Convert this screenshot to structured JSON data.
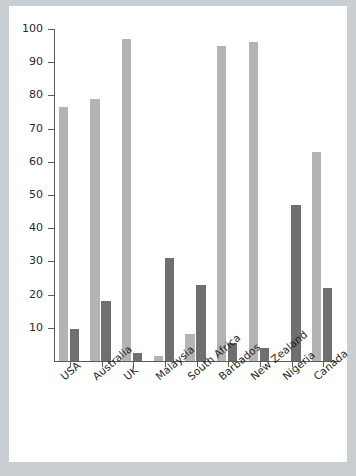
{
  "chart_data": {
    "type": "bar",
    "title": "",
    "subtitle": "",
    "xlabel": "",
    "ylabel": "",
    "ylim": [
      0,
      100
    ],
    "yticks": [
      10,
      20,
      30,
      40,
      50,
      60,
      70,
      80,
      90,
      100
    ],
    "ytick_labels": [
      "10",
      "20",
      "30",
      "40",
      "50",
      "60",
      "70",
      "80",
      "90",
      "100"
    ],
    "grid": false,
    "legend": "none",
    "categories": [
      "USA",
      "Australia",
      "UK",
      "Malaysia",
      "South Africa",
      "Barbados",
      "New Zealand",
      "Nigeria",
      "Canada"
    ],
    "series": [
      {
        "name": "series-1",
        "color": "#b4b4b4",
        "values": [
          76.5,
          79,
          97,
          1.5,
          8,
          95,
          96,
          0,
          63
        ]
      },
      {
        "name": "series-2",
        "color": "#6f6f6f",
        "values": [
          9.5,
          18,
          2.5,
          31,
          23,
          5.5,
          4,
          47,
          22
        ]
      }
    ]
  },
  "style": {
    "page_background": "#c9ced3",
    "plot_background": "#ffffff",
    "axis_color": "#5a5a5a",
    "tick_label_color": "#2a2a2a",
    "category_label_rotation": "-40deg"
  }
}
